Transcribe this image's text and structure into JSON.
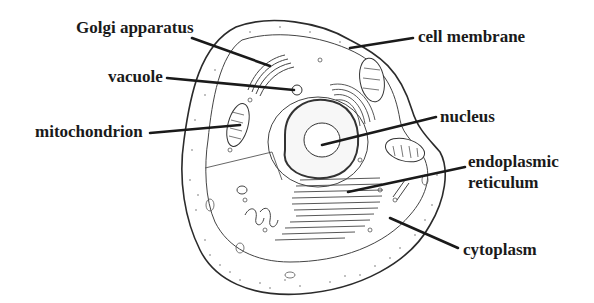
{
  "diagram": {
    "colors": {
      "ink": "#1a1a1a",
      "background": "#ffffff",
      "outline": "#333333"
    },
    "labels": [
      {
        "id": "golgi",
        "text": "Golgi apparatus",
        "x": 76,
        "y": 18,
        "line": [
          192,
          38,
          270,
          66
        ]
      },
      {
        "id": "vacuole",
        "text": "vacuole",
        "x": 108,
        "y": 67,
        "line": [
          167,
          78,
          294,
          90
        ]
      },
      {
        "id": "mitochondrion",
        "text": "mitochondrion",
        "x": 35,
        "y": 122,
        "line": [
          150,
          133,
          240,
          125
        ]
      },
      {
        "id": "cell-membrane",
        "text": "cell membrane",
        "x": 418,
        "y": 26,
        "line": [
          413,
          38,
          350,
          48
        ]
      },
      {
        "id": "nucleus",
        "text": "nucleus",
        "x": 440,
        "y": 107,
        "line": [
          436,
          117,
          322,
          145
        ]
      },
      {
        "id": "endoplasmic-reticulum",
        "text_line1": "endoplasmic",
        "text_line2": "reticulum",
        "x": 468,
        "y": 150,
        "line": [
          465,
          167,
          348,
          192
        ]
      },
      {
        "id": "cytoplasm",
        "text": "cytoplasm",
        "x": 463,
        "y": 240,
        "line": [
          458,
          248,
          390,
          218
        ]
      }
    ]
  }
}
